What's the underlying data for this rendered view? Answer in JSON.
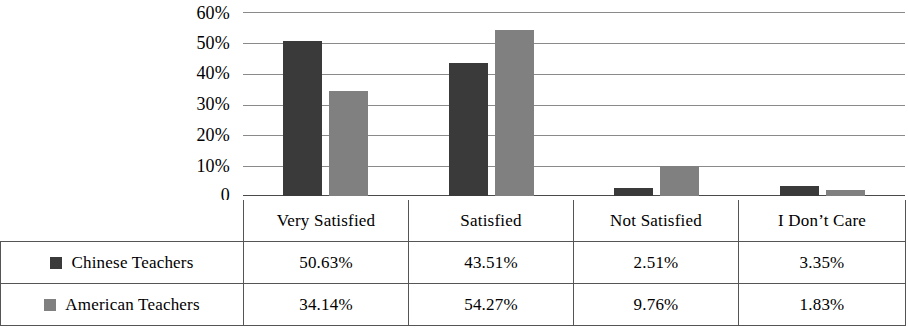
{
  "chart_data": {
    "type": "bar",
    "title": "",
    "subtitle": "",
    "xlabel": "",
    "ylabel": "",
    "ylim": [
      0,
      60
    ],
    "grid": true,
    "legend_position": "table-left",
    "y_ticks": [
      "60%",
      "50%",
      "40%",
      "30%",
      "20%",
      "10%",
      "0"
    ],
    "y_tick_values": [
      60,
      50,
      40,
      30,
      20,
      10,
      0
    ],
    "categories": [
      "Very Satisfied",
      "Satisfied",
      "Not Satisfied",
      "I Don’t Care"
    ],
    "series": [
      {
        "name": "Chinese Teachers",
        "color": "#3a3a3a",
        "values": [
          50.63,
          43.51,
          2.51,
          3.35
        ],
        "labels": [
          "50.63%",
          "43.51%",
          "2.51%",
          "3.35%"
        ]
      },
      {
        "name": "American Teachers",
        "color": "#808080",
        "values": [
          34.14,
          54.27,
          9.76,
          1.83
        ],
        "labels": [
          "34.14%",
          "54.27%",
          "9.76%",
          "1.83%"
        ]
      }
    ]
  },
  "table": {
    "blank_corner": "",
    "column_headers": [
      "Very Satisfied",
      "Satisfied",
      "Not Satisfied",
      "I Don’t Care"
    ],
    "rows": [
      {
        "label": "Chinese Teachers",
        "swatch_color": "#3a3a3a",
        "cells": [
          "50.63%",
          "43.51%",
          "2.51%",
          "3.35%"
        ]
      },
      {
        "label": "American Teachers",
        "swatch_color": "#808080",
        "cells": [
          "34.14%",
          "54.27%",
          "9.76%",
          "1.83%"
        ]
      }
    ]
  }
}
